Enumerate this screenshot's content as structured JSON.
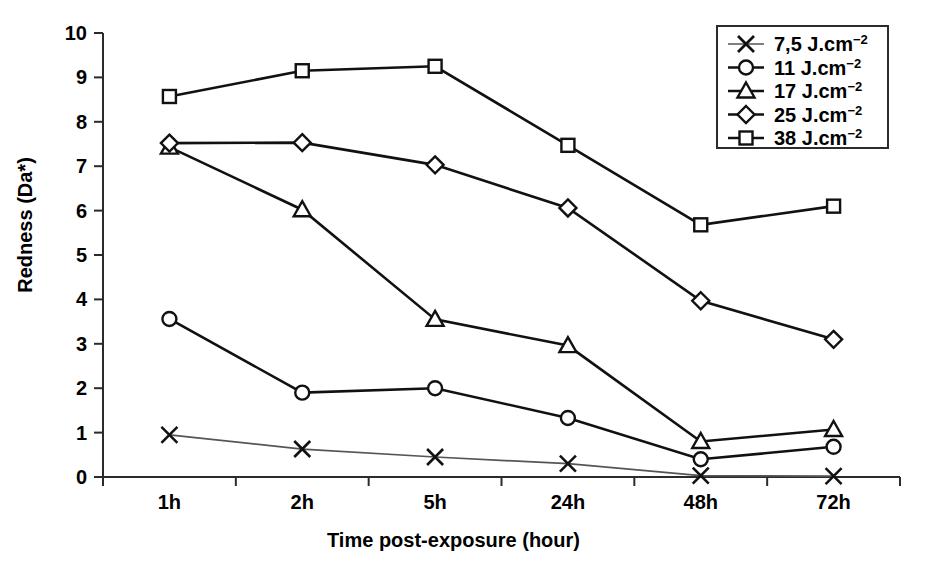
{
  "chart_data": {
    "type": "line",
    "title": "",
    "xlabel": "Time post-exposure (hour)",
    "ylabel": "Redness (Da*)",
    "categories": [
      "1h",
      "2h",
      "5h",
      "24h",
      "48h",
      "72h"
    ],
    "ylim": [
      0,
      10
    ],
    "ytickstep": 1,
    "yticklabels": [
      "0",
      "1",
      "2",
      "3",
      "4",
      "5",
      "6",
      "7",
      "8",
      "9",
      "10"
    ],
    "grid": false,
    "legend_position": "top-right",
    "series": [
      {
        "name": "7,5 J.cm−2",
        "label_value": "7,5",
        "label_unit": "J.cm",
        "label_exp": "−2",
        "marker": "x",
        "line_style": "light",
        "values": [
          0.95,
          0.63,
          0.45,
          0.3,
          0.03,
          0.02
        ]
      },
      {
        "name": "11 J.cm−2",
        "label_value": "11",
        "label_unit": "J.cm",
        "label_exp": "−2",
        "marker": "circle",
        "line_style": "normal",
        "values": [
          3.56,
          1.9,
          2.0,
          1.33,
          0.4,
          0.68
        ]
      },
      {
        "name": "17 J.cm−2",
        "label_value": "17",
        "label_unit": "J.cm",
        "label_exp": "−2",
        "marker": "triangle",
        "line_style": "normal",
        "values": [
          7.43,
          6.02,
          3.55,
          2.96,
          0.8,
          1.07
        ]
      },
      {
        "name": "25 J.cm−2",
        "label_value": "25",
        "label_unit": "J.cm",
        "label_exp": "−2",
        "marker": "diamond",
        "line_style": "normal",
        "values": [
          7.52,
          7.53,
          7.03,
          6.06,
          3.97,
          3.1
        ]
      },
      {
        "name": "38 J.cm−2",
        "label_value": "38",
        "label_unit": "J.cm",
        "label_exp": "−2",
        "marker": "square",
        "line_style": "normal",
        "values": [
          8.57,
          9.15,
          9.25,
          7.47,
          5.68,
          6.1
        ]
      }
    ]
  }
}
